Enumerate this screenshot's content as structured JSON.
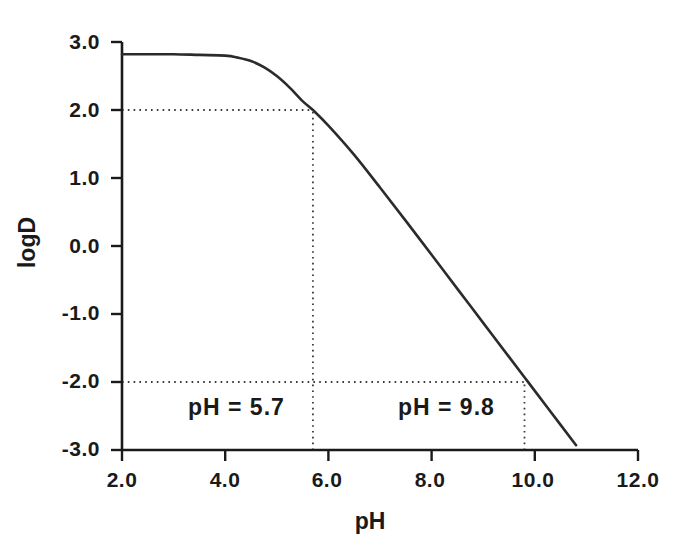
{
  "chart_data": {
    "type": "line",
    "title": "",
    "subtitle": "",
    "xlabel": "pH",
    "ylabel": "logD",
    "xlim": [
      2.0,
      12.0
    ],
    "ylim": [
      -3.0,
      3.0
    ],
    "grid": false,
    "legend": null,
    "x_ticks": [
      2.0,
      4.0,
      6.0,
      8.0,
      10.0,
      12.0
    ],
    "x_tick_labels": [
      "2.0",
      "4.0",
      "6.0",
      "8.0",
      "10.0",
      "12.0"
    ],
    "y_ticks": [
      3.0,
      2.0,
      1.0,
      0.0,
      -1.0,
      -2.0,
      -3.0
    ],
    "y_tick_labels": [
      "3.0",
      "2.0",
      "1.0",
      "0.0",
      "-1.0",
      "-2.0",
      "-3.0"
    ],
    "series": [
      {
        "name": "logD vs pH",
        "x": [
          2.0,
          2.5,
          3.0,
          3.5,
          4.0,
          4.25,
          4.5,
          4.75,
          5.0,
          5.25,
          5.5,
          5.7,
          6.0,
          6.5,
          7.0,
          7.5,
          8.0,
          8.5,
          9.0,
          9.5,
          9.8,
          10.0,
          10.5,
          10.8
        ],
        "y": [
          2.82,
          2.82,
          2.82,
          2.81,
          2.8,
          2.77,
          2.72,
          2.63,
          2.5,
          2.33,
          2.13,
          2.0,
          1.77,
          1.34,
          0.86,
          0.37,
          -0.13,
          -0.63,
          -1.13,
          -1.63,
          -1.93,
          -2.13,
          -2.63,
          -2.93
        ]
      }
    ],
    "annotations": [
      {
        "id": "ph-low",
        "text": "pH  =  5.7",
        "x": 5.7,
        "y": -2.5,
        "marker_x": 5.7,
        "marker_y": 2.0
      },
      {
        "id": "ph-high",
        "text": "pH  =  9.8",
        "x": 9.8,
        "y": -2.5,
        "marker_x": 9.8,
        "marker_y": -2.0
      }
    ],
    "guide_lines": [
      {
        "id": "guide-h-2",
        "orientation": "horizontal",
        "value": 2.0,
        "from": 2.0,
        "to": 5.7,
        "style": "dotted"
      },
      {
        "id": "guide-v-5p7",
        "orientation": "vertical",
        "value": 5.7,
        "from": -3.0,
        "to": 2.0,
        "style": "dotted"
      },
      {
        "id": "guide-h-neg2",
        "orientation": "horizontal",
        "value": -2.0,
        "from": 2.0,
        "to": 9.8,
        "style": "dotted"
      },
      {
        "id": "guide-v-9p8",
        "orientation": "vertical",
        "value": 9.8,
        "from": -3.0,
        "to": -2.0,
        "style": "dotted"
      }
    ],
    "colors": {
      "background": "#ffffff",
      "axis": "#1a1a1a",
      "curve": "#2b2b2b",
      "guide": "#3a3a3a",
      "text": "#1a1a1a"
    },
    "plateau_value": 2.82
  },
  "axis_titles": {
    "x": "pH",
    "y": "logD"
  },
  "annotations": {
    "low": "pH  =  5.7",
    "high": "pH  =  9.8"
  },
  "ticks": {
    "x": [
      "2.0",
      "4.0",
      "6.0",
      "8.0",
      "10.0",
      "12.0"
    ],
    "y": [
      "3.0",
      "2.0",
      "1.0",
      "0.0",
      "-1.0",
      "-2.0",
      "-3.0"
    ]
  }
}
